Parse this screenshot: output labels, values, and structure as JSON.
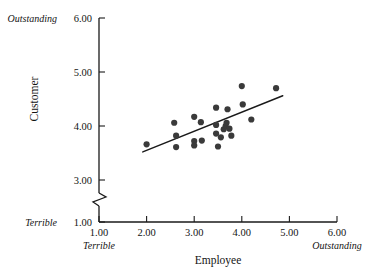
{
  "chart_data": {
    "type": "scatter",
    "title": "",
    "xlabel": "Employee",
    "ylabel": "Customer",
    "xlim": [
      1.0,
      6.0
    ],
    "ylim": [
      1.0,
      6.0
    ],
    "grid": false,
    "legend": "none",
    "y_axis_break": true,
    "y_axis_break_note": "axis broken between 1.00 and 3.00",
    "x_ticks": [
      "1.00",
      "2.00",
      "3.00",
      "4.00",
      "5.00",
      "6.00"
    ],
    "x_tick_values": [
      1.0,
      2.0,
      3.0,
      4.0,
      5.0,
      6.0
    ],
    "y_ticks": [
      "1.00",
      "3.00",
      "4.00",
      "5.00",
      "6.00"
    ],
    "y_tick_values": [
      1.0,
      3.0,
      4.0,
      5.0,
      6.0
    ],
    "x_anchor_low": "Terrible",
    "x_anchor_high": "Outstanding",
    "y_anchor_low": "Terrible",
    "y_anchor_high": "Outstanding",
    "point_color": "#3a3a3a",
    "line_color": "#1a1a1a",
    "points": [
      {
        "x": 2.0,
        "y": 3.66
      },
      {
        "x": 2.58,
        "y": 4.06
      },
      {
        "x": 2.62,
        "y": 3.82
      },
      {
        "x": 2.62,
        "y": 3.61
      },
      {
        "x": 3.0,
        "y": 4.17
      },
      {
        "x": 3.0,
        "y": 3.72
      },
      {
        "x": 3.0,
        "y": 3.64
      },
      {
        "x": 3.14,
        "y": 4.07
      },
      {
        "x": 3.16,
        "y": 3.73
      },
      {
        "x": 3.46,
        "y": 4.34
      },
      {
        "x": 3.46,
        "y": 4.02
      },
      {
        "x": 3.46,
        "y": 3.86
      },
      {
        "x": 3.5,
        "y": 3.62
      },
      {
        "x": 3.56,
        "y": 3.79
      },
      {
        "x": 3.62,
        "y": 3.94
      },
      {
        "x": 3.66,
        "y": 4.0
      },
      {
        "x": 3.68,
        "y": 4.06
      },
      {
        "x": 3.7,
        "y": 4.31
      },
      {
        "x": 3.74,
        "y": 3.95
      },
      {
        "x": 3.78,
        "y": 3.82
      },
      {
        "x": 4.0,
        "y": 4.74
      },
      {
        "x": 4.02,
        "y": 4.4
      },
      {
        "x": 4.2,
        "y": 4.12
      },
      {
        "x": 4.72,
        "y": 4.7
      }
    ],
    "trend_line": {
      "x_start": 1.92,
      "y_start": 3.52,
      "x_end": 4.86,
      "y_end": 4.56
    }
  }
}
